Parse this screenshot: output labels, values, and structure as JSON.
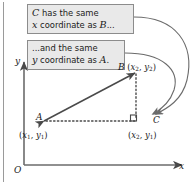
{
  "figure": {
    "type": "geometry-diagram",
    "background_color": "#ffffff",
    "line_color": "#4a4a4a",
    "callout_fill": "#e9e9e9",
    "callout_border": "#8c8c8c"
  },
  "callouts": [
    {
      "id": "callout-1",
      "line1_pre": "",
      "line1_var": "C",
      "line1_post": " has the same",
      "line2_var": "x",
      "line2_post": " coordinate as ",
      "line2_var2": "B",
      "line2_end": "...",
      "full_text": "C has the same x coordinate as B..."
    },
    {
      "id": "callout-2",
      "line1_post": "...and the same",
      "line2_var": "y",
      "line2_post": " coordinate as ",
      "line2_var2": "A",
      "line2_end": ".",
      "full_text": "...and the same y coordinate as A."
    }
  ],
  "axes": {
    "y_label": "y",
    "x_label": "x",
    "origin_label": "O"
  },
  "points": {
    "a": {
      "name": "A",
      "coord_open": "(",
      "coord_x": "x",
      "coord_x_sub": "1",
      "coord_sep": ", ",
      "coord_y": "y",
      "coord_y_sub": "1",
      "coord_close": ")",
      "coord_text": "(x1, y1)"
    },
    "b": {
      "name": "B",
      "coord_open": "(",
      "coord_x": "x",
      "coord_x_sub": "2",
      "coord_sep": ", ",
      "coord_y": "y",
      "coord_y_sub": "2",
      "coord_close": ")",
      "coord_text": "(x2, y2)"
    },
    "c": {
      "name": "C",
      "coord_open": "(",
      "coord_x": "x",
      "coord_x_sub": "2",
      "coord_sep": ", ",
      "coord_y": "y",
      "coord_y_sub": "1",
      "coord_close": ")",
      "coord_text": "(x2, y1)"
    }
  }
}
